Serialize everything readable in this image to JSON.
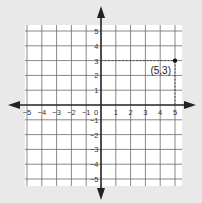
{
  "chart_data": {
    "type": "scatter",
    "title": "",
    "xlabel": "",
    "ylabel": "",
    "xlim": [
      -5,
      5
    ],
    "ylim": [
      -5,
      5
    ],
    "grid": true,
    "x_ticks": [
      -5,
      -4,
      -3,
      -2,
      -1,
      0,
      1,
      2,
      3,
      4,
      5
    ],
    "y_ticks": [
      -5,
      -4,
      -3,
      -2,
      -1,
      1,
      2,
      3,
      4,
      5
    ],
    "points": [
      {
        "x": 5,
        "y": 3,
        "label": "(5,3)"
      }
    ],
    "annotations": [
      "dashed guide lines from (0,3) to (5,3) and (5,0) to (5,3)"
    ]
  },
  "colors": {
    "background": "#e9e9e9",
    "grid_bg": "#ffffff",
    "grid_line": "#6a6a6a",
    "axis": "#222222"
  },
  "point_label": "(5,3)"
}
